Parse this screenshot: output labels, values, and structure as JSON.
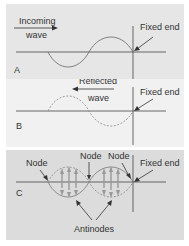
{
  "panels": [
    {
      "id": "A",
      "label": "A",
      "caption_line1": "Incoming",
      "caption_line2": "wave",
      "fixed_end": "Fixed end"
    },
    {
      "id": "B",
      "label": "B",
      "caption_line1": "Reflected",
      "caption_line2": "wave",
      "fixed_end": "Fixed end"
    },
    {
      "id": "C",
      "label": "C",
      "node1": "Node",
      "node2": "Node",
      "node3": "Node",
      "fixed_end": "Fixed end",
      "antinodes": "Antinodes"
    }
  ],
  "colors": {
    "panel_a_bg": "#e6e6e6",
    "panel_b_bg": "#f1f1f1",
    "panel_c_bg": "#dcdcdc",
    "line": "#444444",
    "wave": "#777777"
  }
}
